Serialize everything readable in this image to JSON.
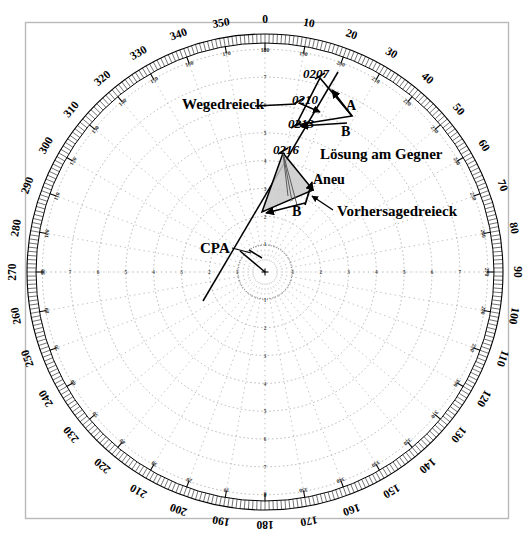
{
  "figure": {
    "type": "polar-radar-plot",
    "center": {
      "x": 265,
      "y": 272
    },
    "outer_radius": 238,
    "frame": {
      "x": 25,
      "y": 22,
      "width": 483,
      "height": 496,
      "color": "#b9b9b9"
    },
    "background": "#ffffff",
    "ink": "#000000",
    "fill_gray": "#c9c9c9",
    "dot_gray": "#9a9a9a"
  },
  "compass": {
    "outer_labels": [
      "0",
      "10",
      "20",
      "30",
      "40",
      "50",
      "60",
      "70",
      "80",
      "90",
      "100",
      "110",
      "120",
      "130",
      "140",
      "150",
      "160",
      "170",
      "180",
      "190",
      "200",
      "210",
      "220",
      "230",
      "240",
      "250",
      "260",
      "270",
      "280",
      "290",
      "300",
      "310",
      "320",
      "330",
      "340",
      "350"
    ],
    "inner_labels": [
      "180",
      "190",
      "200",
      "210",
      "220",
      "230",
      "240",
      "250",
      "260",
      "270",
      "280",
      "290",
      "300",
      "310",
      "320",
      "330",
      "340",
      "350",
      "0",
      "10",
      "20",
      "30",
      "40",
      "50",
      "60",
      "70",
      "80",
      "90",
      "100",
      "110",
      "120",
      "130",
      "140",
      "150",
      "160",
      "170"
    ],
    "step_degrees": 10,
    "minor_tick_degrees": 1
  },
  "range_rings": {
    "labels": [
      "1",
      "2",
      "3",
      "4",
      "5",
      "6",
      "7",
      "8"
    ],
    "count": 8,
    "style": "dotted"
  },
  "annotations": {
    "wegedreieck": "Wegedreieck",
    "loesung": "Lösung am Gegner",
    "vorhersage": "Vorhersagedreieck",
    "cpa": "CPA"
  },
  "plot_points": [
    {
      "label": "0207",
      "x": 320,
      "y": 76
    },
    {
      "label": "0210",
      "x": 299,
      "y": 101
    },
    {
      "label": "0213",
      "x": 296,
      "y": 125
    },
    {
      "label": "0216",
      "x": 283,
      "y": 151
    }
  ],
  "vectors": {
    "course_triangle": [
      {
        "label": "A",
        "x": 343,
        "y": 103
      },
      {
        "label": "B",
        "x": 344,
        "y": 129
      }
    ],
    "prediction_triangle": [
      {
        "label": "Aneu",
        "x": 313,
        "y": 178
      },
      {
        "label": "B",
        "x": 296,
        "y": 212
      }
    ]
  }
}
